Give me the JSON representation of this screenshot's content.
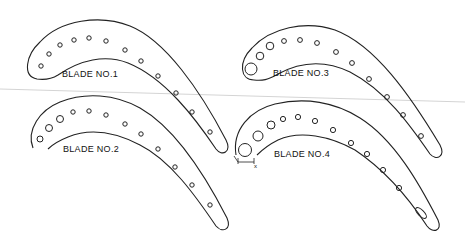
{
  "figure": {
    "type": "technical-drawing",
    "background": "#ffffff",
    "line_color": "#222222"
  },
  "blades": [
    {
      "id": 1,
      "label": "BLADE NO.1",
      "label_pos": [
        62,
        77
      ],
      "outer_path": "M 37 79 C 22 76 26 55 40 42 C 60 20 100 14 130 26 C 165 40 200 90 226 140 C 232 152 222 157 216 149 C 195 118 165 78 128 63 C 105 54 80 60 58 75 C 50 80 44 80 37 79 Z",
      "holes": [
        {
          "cx": 41,
          "cy": 66,
          "r": 2.2
        },
        {
          "cx": 49,
          "cy": 54,
          "r": 2.2
        },
        {
          "cx": 60,
          "cy": 45,
          "r": 2.2
        },
        {
          "cx": 74,
          "cy": 40,
          "r": 2.2
        },
        {
          "cx": 89,
          "cy": 38,
          "r": 2.2
        },
        {
          "cx": 106,
          "cy": 41,
          "r": 2.2
        },
        {
          "cx": 125,
          "cy": 50,
          "r": 2.2
        },
        {
          "cx": 141,
          "cy": 61,
          "r": 2.2
        },
        {
          "cx": 158,
          "cy": 76,
          "r": 2.2
        },
        {
          "cx": 176,
          "cy": 93,
          "r": 2.2
        },
        {
          "cx": 192,
          "cy": 112,
          "r": 2.2
        },
        {
          "cx": 210,
          "cy": 132,
          "r": 2.2
        }
      ]
    },
    {
      "id": 2,
      "label": "BLADE NO.2",
      "label_pos": [
        63,
        152
      ],
      "outer_path": "M 33 148 C 26 130 40 110 60 102 C 85 92 115 94 140 108 C 175 128 205 175 227 218 C 232 230 222 233 216 226 C 195 195 170 160 140 145 C 115 132 90 128 68 137 C 58 141 52 145 48 149",
      "holes": [
        {
          "cx": 40,
          "cy": 139,
          "r": 3
        },
        {
          "cx": 49,
          "cy": 128,
          "r": 3.5
        },
        {
          "cx": 60,
          "cy": 119,
          "r": 3.5
        },
        {
          "cx": 73,
          "cy": 112,
          "r": 2.2
        },
        {
          "cx": 89,
          "cy": 111,
          "r": 2.2
        },
        {
          "cx": 106,
          "cy": 115,
          "r": 2.2
        },
        {
          "cx": 125,
          "cy": 124,
          "r": 2.2
        },
        {
          "cx": 141,
          "cy": 134,
          "r": 2.2
        },
        {
          "cx": 158,
          "cy": 149,
          "r": 2.2
        },
        {
          "cx": 175,
          "cy": 167,
          "r": 2.2
        },
        {
          "cx": 192,
          "cy": 185,
          "r": 2.2
        },
        {
          "cx": 210,
          "cy": 205,
          "r": 2.2
        }
      ]
    },
    {
      "id": 3,
      "label": "BLADE NO.3",
      "label_pos": [
        273,
        76
      ],
      "outer_path": "M 254 80 C 240 80 238 62 252 48 C 270 28 305 20 335 30 C 375 45 410 95 440 145 C 446 157 436 161 430 154 C 410 125 385 90 350 72 C 325 60 300 62 278 74 C 268 80 262 81 254 80 Z",
      "holes": [
        {
          "cx": 251,
          "cy": 69,
          "r": 6
        },
        {
          "cx": 260,
          "cy": 56,
          "r": 3.8
        },
        {
          "cx": 270,
          "cy": 46,
          "r": 3.8
        },
        {
          "cx": 284,
          "cy": 41,
          "r": 2.4
        },
        {
          "cx": 300,
          "cy": 40,
          "r": 2.4
        },
        {
          "cx": 317,
          "cy": 43,
          "r": 2.4
        },
        {
          "cx": 336,
          "cy": 52,
          "r": 2.4
        },
        {
          "cx": 352,
          "cy": 63,
          "r": 2.4
        },
        {
          "cx": 369,
          "cy": 79,
          "r": 2.4
        },
        {
          "cx": 387,
          "cy": 97,
          "r": 2.4
        },
        {
          "cx": 403,
          "cy": 115,
          "r": 2.4
        },
        {
          "cx": 421,
          "cy": 136,
          "r": 2.4
        }
      ]
    },
    {
      "id": 4,
      "label": "BLADE NO.4",
      "label_pos": [
        274,
        157
      ],
      "outer_path": "M 236 155 C 232 130 250 110 275 104 C 305 97 335 102 360 118 C 395 140 420 185 438 220 C 443 232 432 233 427 226 C 410 200 385 170 355 150 C 330 136 300 130 278 140 C 270 144 262 150 257 155",
      "holes": [
        {
          "cx": 245,
          "cy": 150,
          "r": 6.5
        },
        {
          "cx": 258,
          "cy": 136,
          "r": 5
        },
        {
          "cx": 271,
          "cy": 125,
          "r": 4
        },
        {
          "cx": 283,
          "cy": 119,
          "r": 2.6
        },
        {
          "cx": 298,
          "cy": 117,
          "r": 2.6
        },
        {
          "cx": 315,
          "cy": 121,
          "r": 2.6
        },
        {
          "cx": 333,
          "cy": 130,
          "r": 2.6
        },
        {
          "cx": 351,
          "cy": 143,
          "r": 2.6
        },
        {
          "cx": 367,
          "cy": 154,
          "r": 2.6
        },
        {
          "cx": 383,
          "cy": 170,
          "r": 2.6
        },
        {
          "cx": 399,
          "cy": 188,
          "r": 2.6
        }
      ],
      "slot": {
        "cx": 421,
        "cy": 213,
        "rx": 7,
        "ry": 3,
        "rotate": 45
      },
      "dimension_mark": {
        "label": "x",
        "pos": [
          254,
          165
        ]
      }
    }
  ],
  "guide_line": {
    "x1": 0,
    "y1": 89,
    "x2": 465,
    "y2": 102,
    "color": "#d4d4d4"
  }
}
